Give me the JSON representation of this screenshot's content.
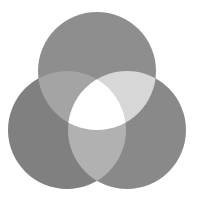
{
  "figure": {
    "background": "#ffffff",
    "circles": [
      {
        "id": "top",
        "cx": 97,
        "cy": 71,
        "r": 59,
        "color": "#8e8e8e"
      },
      {
        "id": "left",
        "cx": 67,
        "cy": 130,
        "r": 59,
        "color": "#808080"
      },
      {
        "id": "right",
        "cx": 127,
        "cy": 130,
        "r": 59,
        "color": "#898989"
      }
    ],
    "overlaps": {
      "top_left": "#a4a4a4",
      "top_right": "#d7d7d7",
      "left_right": "#b1b1b1",
      "center": "#ffffff"
    }
  }
}
